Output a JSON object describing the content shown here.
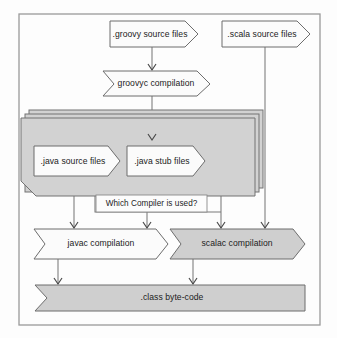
{
  "diagram": {
    "colors": {
      "shape_fill_light": "#fbfbfb",
      "shape_fill_gray": "#cfcfcf",
      "stack_fill": "#d2d2d2",
      "stroke": "#6d6d6d",
      "frame_stroke": "#9a9a9a",
      "text": "#1c1c1c",
      "background": "#fdfdfd"
    },
    "nodes": {
      "groovy_source": {
        "label": ".groovy source files",
        "shape": "arrow-right",
        "fill": "light"
      },
      "scala_source": {
        "label": ".scala source files",
        "shape": "arrow-right",
        "fill": "light"
      },
      "groovyc": {
        "label": "groovyc compilation",
        "shape": "chevron",
        "fill": "light"
      },
      "java_source": {
        "label": ".java source files",
        "shape": "arrow-right",
        "fill": "light"
      },
      "java_stub": {
        "label": ".java stub files",
        "shape": "arrow-right",
        "fill": "light"
      },
      "decision": {
        "label": "Which Compiler is used?",
        "shape": "label-box",
        "fill": "light"
      },
      "javac": {
        "label": "javac compilation",
        "shape": "chevron",
        "fill": "light"
      },
      "scalac": {
        "label": "scalac compilation",
        "shape": "chevron",
        "fill": "gray"
      },
      "class_output": {
        "label": ".class byte-code",
        "shape": "ribbon",
        "fill": "gray"
      }
    },
    "stack": {
      "layers": 3,
      "label": ""
    },
    "edges": [
      {
        "from": "groovy_source",
        "to": "groovyc"
      },
      {
        "from": "groovyc",
        "to": "java_stub"
      },
      {
        "from": "java_source",
        "to": "javac"
      },
      {
        "from": "java_stub",
        "to": "javac"
      },
      {
        "from": "java_stub",
        "to": "scalac"
      },
      {
        "from": "scala_source",
        "to": "scalac"
      },
      {
        "from": "javac",
        "to": "class_output"
      },
      {
        "from": "scalac",
        "to": "class_output"
      }
    ]
  }
}
